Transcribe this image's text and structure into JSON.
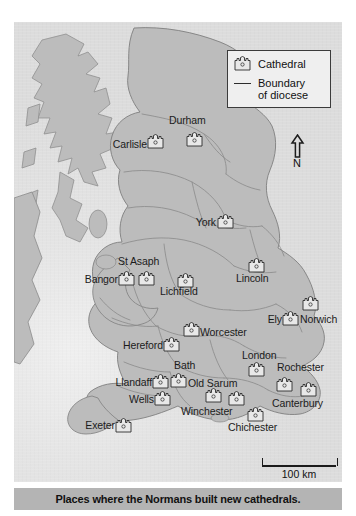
{
  "caption": {
    "text": "Places where the Normans built new cathedrals."
  },
  "legend": {
    "cathedral_label": "Cathedral",
    "boundary_label_line1": "Boundary",
    "boundary_label_line2": "of diocese"
  },
  "compass": {
    "label": "N"
  },
  "scale": {
    "label": "100 km"
  },
  "colors": {
    "land": "#b9b9b9",
    "sea": "#e3e3e3",
    "boundary": "#8a8a8a",
    "coast": "#7a7a7a",
    "caption_bar": "#b4b4b4",
    "text": "#1b1b1b"
  },
  "map": {
    "title_implied": "Norman cathedrals of England and Wales",
    "cathedrals": [
      {
        "name": "Carlisle",
        "label_x": 74,
        "label_y": 117,
        "align": "right",
        "icon_x": 133,
        "icon_y": 112
      },
      {
        "name": "Durham",
        "label_x": 169,
        "label_y": 95,
        "align": "left",
        "icon_x": 172,
        "icon_y": 110
      },
      {
        "name": "York",
        "label_x": 172,
        "label_y": 195,
        "align": "left",
        "icon_x": 203,
        "icon_y": 192
      },
      {
        "name": "St Asaph",
        "label_x": 106,
        "label_y": 236,
        "align": "left",
        "icon_x": 124,
        "icon_y": 249
      },
      {
        "name": "Bangor",
        "label_x": 103,
        "label_y": 250,
        "align": "right",
        "icon_x": 104,
        "icon_y": 249
      },
      {
        "name": "Lichfield",
        "label_x": 146,
        "label_y": 264,
        "align": "left",
        "icon_x": 163,
        "icon_y": 251
      },
      {
        "name": "Lincoln",
        "label_x": 222,
        "label_y": 251,
        "align": "left",
        "icon_x": 234,
        "icon_y": 236
      },
      {
        "name": "Ely",
        "label_x": 253,
        "label_y": 291,
        "align": "left",
        "icon_x": 268,
        "icon_y": 289
      },
      {
        "name": "Norwich",
        "label_x": 287,
        "label_y": 291,
        "align": "left",
        "icon_x": 288,
        "icon_y": 274
      },
      {
        "name": "Worcester",
        "label_x": 166,
        "label_y": 307,
        "align": "left",
        "icon_x": 169,
        "icon_y": 300
      },
      {
        "name": "Hereford",
        "label_x": 148,
        "label_y": 318,
        "align": "right",
        "icon_x": 149,
        "icon_y": 315
      },
      {
        "name": "London",
        "label_x": 229,
        "label_y": 328,
        "align": "left",
        "icon_x": 234,
        "icon_y": 340
      },
      {
        "name": "Rochester",
        "label_x": 268,
        "label_y": 341,
        "align": "left",
        "icon_x": 262,
        "icon_y": 355
      },
      {
        "name": "Bath",
        "label_x": 161,
        "label_y": 339,
        "align": "left",
        "icon_x": 156,
        "icon_y": 351
      },
      {
        "name": "Old Sarum",
        "label_x": 191,
        "label_y": 355,
        "align": "left",
        "icon_x": 191,
        "icon_y": 366
      },
      {
        "name": "Llandaff",
        "label_x": 138,
        "label_y": 355,
        "align": "right",
        "icon_x": 138,
        "icon_y": 352
      },
      {
        "name": "Wells",
        "label_x": 139,
        "label_y": 371,
        "align": "right",
        "icon_x": 140,
        "icon_y": 369
      },
      {
        "name": "Winchester",
        "label_x": 185,
        "label_y": 385,
        "align": "left",
        "icon_x": 214,
        "icon_y": 369
      },
      {
        "name": "Canterbury",
        "label_x": 272,
        "label_y": 375,
        "align": "left",
        "icon_x": 286,
        "icon_y": 360
      },
      {
        "name": "Chichester",
        "label_x": 228,
        "label_y": 400,
        "align": "left",
        "icon_x": 233,
        "icon_y": 385
      },
      {
        "name": "Exeter",
        "label_x": 100,
        "label_y": 398,
        "align": "right",
        "icon_x": 101,
        "icon_y": 396
      }
    ]
  }
}
